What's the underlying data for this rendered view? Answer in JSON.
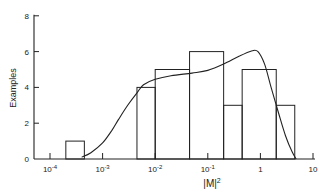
{
  "chart_data": {
    "type": "bar",
    "subtype": "histogram_with_curve",
    "title": "",
    "xlabel": "|M|²",
    "ylabel": "Examples",
    "xscale": "log",
    "xlim": [
      4e-05,
      12
    ],
    "ylim": [
      0,
      8
    ],
    "grid": false,
    "legend": null,
    "yticks": [
      0,
      2,
      4,
      6,
      8
    ],
    "ytick_labels": [
      "0",
      "2",
      "4",
      "6",
      "8"
    ],
    "xticks": [
      0.0001,
      0.001,
      0.01,
      0.1,
      1,
      10
    ],
    "xtick_labels": [
      {
        "base": "10",
        "exp": "-4"
      },
      {
        "base": "10",
        "exp": "-3"
      },
      {
        "base": "10",
        "exp": "-2"
      },
      {
        "base": "10",
        "exp": "-1"
      },
      {
        "base": "1",
        "exp": ""
      },
      {
        "base": "10",
        "exp": ""
      }
    ],
    "histogram": {
      "bins": [
        {
          "x0": 0.0002,
          "x1": 0.00045,
          "count": 1
        },
        {
          "x0": 0.0045,
          "x1": 0.01,
          "count": 4
        },
        {
          "x0": 0.01,
          "x1": 0.045,
          "count": 5
        },
        {
          "x0": 0.045,
          "x1": 0.2,
          "count": 6
        },
        {
          "x0": 0.2,
          "x1": 0.45,
          "count": 3
        },
        {
          "x0": 0.45,
          "x1": 2.0,
          "count": 5
        },
        {
          "x0": 2.0,
          "x1": 4.5,
          "count": 3
        }
      ]
    },
    "curve": {
      "name": "fitted distribution",
      "points": [
        [
          0.0004,
          0.1
        ],
        [
          0.0006,
          0.35
        ],
        [
          0.001,
          0.9
        ],
        [
          0.0015,
          1.6
        ],
        [
          0.002,
          2.2
        ],
        [
          0.003,
          3.0
        ],
        [
          0.0045,
          3.7
        ],
        [
          0.006,
          4.15
        ],
        [
          0.01,
          4.45
        ],
        [
          0.02,
          4.65
        ],
        [
          0.05,
          4.8
        ],
        [
          0.1,
          4.95
        ],
        [
          0.2,
          5.3
        ],
        [
          0.4,
          5.75
        ],
        [
          0.7,
          6.05
        ],
        [
          0.9,
          6.0
        ],
        [
          1.2,
          5.3
        ],
        [
          1.6,
          4.0
        ],
        [
          2.2,
          2.6
        ],
        [
          3.0,
          1.3
        ],
        [
          4.0,
          0.4
        ],
        [
          4.8,
          0.0
        ]
      ]
    }
  }
}
